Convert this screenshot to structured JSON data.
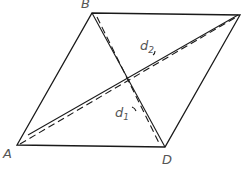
{
  "diagram": {
    "title": "",
    "shape": "rhombus",
    "vertices": [
      {
        "name": "A",
        "x": 17,
        "y": 145,
        "label": "A",
        "label_x": 3,
        "label_y": 158
      },
      {
        "name": "B",
        "x": 92,
        "y": 13,
        "label": "B",
        "label_x": 81,
        "label_y": 8
      },
      {
        "name": "C",
        "x": 240,
        "y": 15,
        "label": "",
        "label_x": 0,
        "label_y": 0
      },
      {
        "name": "D",
        "x": 165,
        "y": 147,
        "label": "D",
        "label_x": 162,
        "label_y": 164
      }
    ],
    "diagonals": [
      {
        "name": "d1",
        "from": "B",
        "to": "D",
        "label": "d",
        "subscript": "1",
        "label_x": 115,
        "label_y": 117
      },
      {
        "name": "d2",
        "from": "A",
        "to": "C",
        "label": "d",
        "subscript": "2",
        "label_x": 140,
        "label_y": 50
      }
    ],
    "colors": {
      "line": "#1a1a1a",
      "label": "#555555",
      "background": "#ffffff"
    }
  }
}
